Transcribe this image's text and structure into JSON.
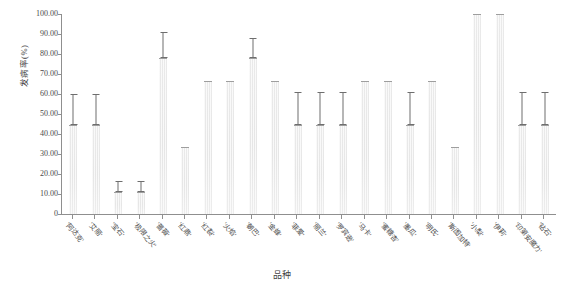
{
  "chart_data": {
    "type": "bar",
    "title": "",
    "xlabel": "品种",
    "ylabel": "发病率(%)",
    "ylim": [
      0,
      100
    ],
    "ytick_labels": [
      "100.00",
      "90.00",
      "80.00",
      "70.00",
      "60.00",
      "50.00",
      "40.00",
      "30.00",
      "20.00",
      "10.00",
      "0"
    ],
    "ytick_values": [
      100,
      90,
      80,
      70,
      60,
      50,
      40,
      30,
      20,
      10,
      0
    ],
    "grid": false,
    "legend": "none",
    "error_bar_style": "upper-whisker-with-caps",
    "categories": [
      "'阿达克'",
      "'艾丽'",
      "'宝石'",
      "'极限之火'",
      "'蔷薇'",
      "'红鼎'",
      "'红裂'",
      "'火焰'",
      "'朝巴'",
      "'金蜂'",
      "'菲爱'",
      "'丽兰'",
      "'罗宾逊'",
      "'马卡'",
      "'蜜糖杏'",
      "'墨瓜'",
      "'明氏'",
      "'斯图加特'",
      "'小梨'",
      "'伊莉'",
      "'印第安魔力'",
      "'钻石'"
    ],
    "values": [
      44.44,
      44.44,
      11.11,
      11.11,
      77.78,
      33.33,
      66.67,
      66.67,
      77.78,
      66.67,
      44.44,
      44.44,
      44.44,
      66.67,
      66.67,
      44.44,
      66.67,
      33.33,
      100.0,
      100.0,
      44.44,
      44.44
    ],
    "error_upper": [
      60.0,
      60.0,
      16.67,
      16.67,
      91.0,
      33.33,
      66.67,
      66.67,
      88.0,
      66.67,
      61.0,
      61.0,
      61.0,
      66.67,
      66.67,
      61.0,
      66.67,
      33.33,
      100.0,
      100.0,
      61.0,
      61.0
    ],
    "colors": {
      "bar_fill": "#e8e8e8",
      "bar_edge": "#9e9e9e",
      "error_bar": "#6e6e6e",
      "axis": "#8f8f8f",
      "text": "#4a4a4a",
      "background": "#ffffff"
    }
  }
}
